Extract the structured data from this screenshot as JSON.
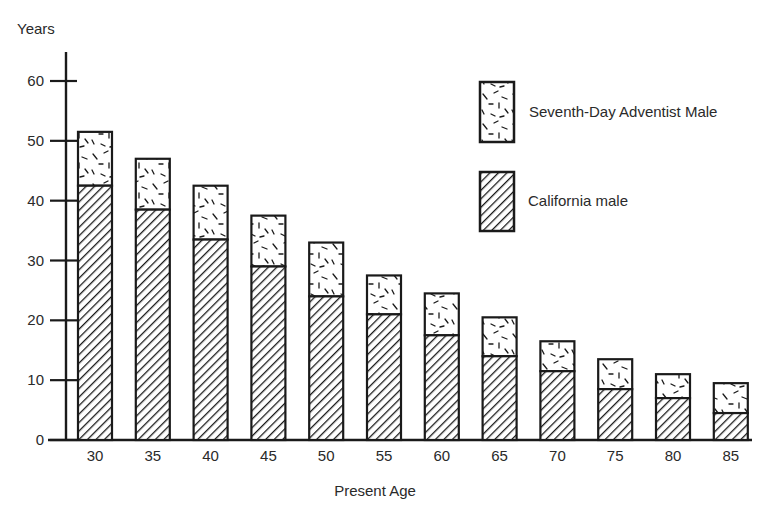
{
  "chart_data": {
    "type": "bar",
    "stacked": true,
    "title": "",
    "xlabel": "Present Age",
    "ylabel": "Years",
    "ylim": [
      0,
      60
    ],
    "yticks": [
      0,
      10,
      20,
      30,
      40,
      50,
      60
    ],
    "grid": false,
    "legend_position": "upper-right",
    "categories": [
      "30",
      "35",
      "40",
      "45",
      "50",
      "55",
      "60",
      "65",
      "70",
      "75",
      "80",
      "85"
    ],
    "series": [
      {
        "name": "California male",
        "pattern": "diagonal-hatch",
        "values": [
          42.5,
          38.5,
          33.5,
          29,
          24,
          21,
          17.5,
          14,
          11.5,
          8.5,
          7,
          4.5
        ]
      },
      {
        "name": "Seventh-Day Adventist Male",
        "pattern": "random-dash-speckle",
        "note": "total bar height (stacked top)",
        "totals": [
          51.5,
          47,
          42.5,
          37.5,
          33,
          27.5,
          24.5,
          20.5,
          16.5,
          13.5,
          11,
          9.5
        ],
        "values": [
          9,
          8.5,
          9,
          8.5,
          9,
          6.5,
          7,
          6.5,
          5,
          5,
          4,
          5
        ]
      }
    ]
  },
  "legend": {
    "items": [
      {
        "label": "Seventh-Day Adventist Male",
        "pattern": "speckle"
      },
      {
        "label": "California male",
        "pattern": "hatch"
      }
    ]
  },
  "axes": {
    "y_title": "Years",
    "x_title": "Present Age"
  },
  "colors": {
    "ink": "#1a1a1a",
    "background": "#ffffff"
  }
}
